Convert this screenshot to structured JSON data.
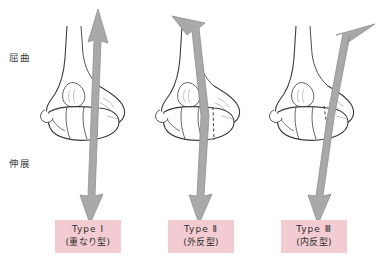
{
  "figure": {
    "title": "",
    "axis_labels": {
      "flexion": "屈曲",
      "extension": "伸展"
    },
    "colors": {
      "arrow_fill": "#a9a9a9",
      "arrow_stroke": "#8f8f8f",
      "bone_outline": "#3c3c3c",
      "bone_fill": "#ffffff",
      "label_background": "#f2ccd2",
      "label_text": "#2e2e2e",
      "background": "#ffffff"
    },
    "panels": [
      {
        "id": "type-1",
        "type_label": "Type Ⅰ",
        "subtype_label": "(重なり型)",
        "arrow": "double-headed-arrow-vertical",
        "arrow_top_direction": "up-right",
        "arrow_bottom_direction": "down"
      },
      {
        "id": "type-2",
        "type_label": "Type Ⅱ",
        "subtype_label": "(外反型)",
        "arrow": "double-headed-arrow-diagonal-left",
        "arrow_top_direction": "up-left",
        "arrow_bottom_direction": "down-left"
      },
      {
        "id": "type-3",
        "type_label": "Type Ⅲ",
        "subtype_label": "(内反型)",
        "arrow": "double-headed-arrow-diagonal-right",
        "arrow_top_direction": "up-right",
        "arrow_bottom_direction": "down-left"
      }
    ]
  }
}
